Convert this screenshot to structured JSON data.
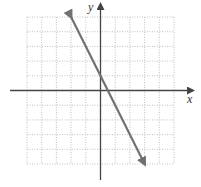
{
  "chart_data": {
    "type": "line",
    "title": "",
    "xlabel": "x",
    "ylabel": "y",
    "xlim": [
      -5,
      5
    ],
    "ylim": [
      -5,
      5
    ],
    "grid": true,
    "series": [
      {
        "name": "y = -2x + 1",
        "x": [
          -2,
          3
        ],
        "y": [
          5,
          -5
        ],
        "slope": -2,
        "intercept": 1,
        "arrows": "both"
      }
    ],
    "colors": {
      "line": "#707070",
      "axis": "#444444",
      "grid": "#b0b0b0"
    }
  },
  "labels": {
    "x_axis": "x",
    "y_axis": "y"
  }
}
